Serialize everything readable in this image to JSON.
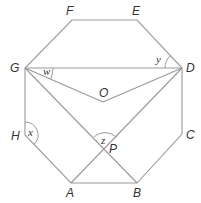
{
  "diagram": {
    "type": "regular-octagon-geometry",
    "colors": {
      "line": "#9a9a9a",
      "text": "#333333",
      "background": "#ffffff"
    },
    "vertices": {
      "A": {
        "label": "A",
        "x": 71,
        "y": 183
      },
      "B": {
        "label": "B",
        "x": 137,
        "y": 183
      },
      "C": {
        "label": "C",
        "x": 182,
        "y": 134
      },
      "D": {
        "label": "D",
        "x": 182,
        "y": 68
      },
      "E": {
        "label": "E",
        "x": 137,
        "y": 20
      },
      "F": {
        "label": "F",
        "x": 72,
        "y": 20
      },
      "G": {
        "label": "G",
        "x": 25,
        "y": 68
      },
      "H": {
        "label": "H",
        "x": 25,
        "y": 135
      }
    },
    "points": {
      "O": {
        "label": "O",
        "x": 103,
        "y": 102
      },
      "P": {
        "label": "P",
        "x": 105,
        "y": 149
      }
    },
    "segments": [
      "AB",
      "BC",
      "CD",
      "DE",
      "EF",
      "FG",
      "GH",
      "HA",
      "GD",
      "GO",
      "OD",
      "GB",
      "DA"
    ],
    "angles": {
      "w": {
        "label": "w",
        "at": "G",
        "between": [
          "GD",
          "GO"
        ]
      },
      "y": {
        "label": "y",
        "at": "D",
        "between": [
          "DE",
          "DG"
        ]
      },
      "x": {
        "label": "x",
        "at": "H",
        "between": [
          "HG",
          "HA"
        ]
      },
      "z": {
        "label": "z",
        "at": "P",
        "between": [
          "PG",
          "PD"
        ]
      }
    }
  }
}
